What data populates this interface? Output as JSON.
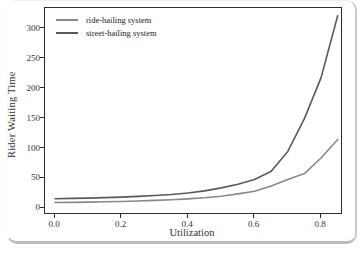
{
  "figure": {
    "background": "#ffffff",
    "frame_shadow_color": "#bdbdbd",
    "plot_border_color": "#2e2e2e"
  },
  "chart_data": {
    "type": "line",
    "title": "",
    "xlabel": "Utilization",
    "ylabel": "Rider Waiting Time",
    "xlim": [
      -0.03,
      0.86
    ],
    "ylim": [
      -8,
      335
    ],
    "grid": false,
    "legend_position": "upper-left",
    "xticks": [
      0.0,
      0.2,
      0.4,
      0.6,
      0.8
    ],
    "xtick_labels": [
      "0.0",
      "0.2",
      "0.4",
      "0.6",
      "0.8"
    ],
    "yticks": [
      0,
      50,
      100,
      150,
      200,
      250,
      300
    ],
    "ytick_labels": [
      "0",
      "50",
      "100",
      "150",
      "200",
      "250",
      "300"
    ],
    "x": [
      0.0,
      0.05,
      0.1,
      0.15,
      0.2,
      0.25,
      0.3,
      0.35,
      0.4,
      0.45,
      0.5,
      0.55,
      0.6,
      0.65,
      0.7,
      0.75,
      0.8,
      0.85
    ],
    "series": [
      {
        "name": "ride-hailing system",
        "color": "#85888c",
        "values": [
          9.5,
          9.8,
          10.2,
          10.7,
          11.3,
          12,
          13,
          14.2,
          15.6,
          17.5,
          20,
          24,
          28.5,
          37,
          48,
          58,
          84,
          115
        ]
      },
      {
        "name": "street-hailing system",
        "color": "#565a62",
        "values": [
          16,
          16.4,
          17,
          17.7,
          18.6,
          19.8,
          21.2,
          23,
          25.5,
          29,
          34,
          40,
          48,
          62,
          95,
          150,
          218,
          322
        ]
      }
    ]
  }
}
